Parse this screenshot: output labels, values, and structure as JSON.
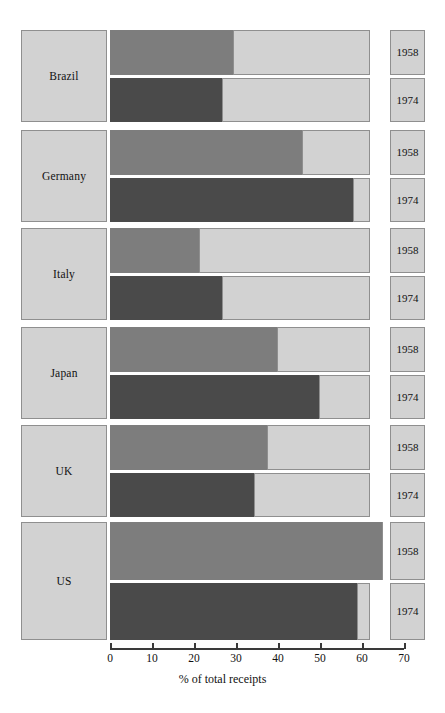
{
  "chart_data": {
    "type": "bar",
    "title": "",
    "xlabel": "% of total receipts",
    "ylabel": "",
    "xlim": [
      0,
      70
    ],
    "xticks": [
      0,
      10,
      20,
      30,
      40,
      50,
      60,
      70
    ],
    "xtick_labels": [
      "0",
      "10",
      "20",
      "30",
      "40",
      "50",
      "60",
      "70"
    ],
    "grid": false,
    "legend": "none",
    "orientation": "horizontal",
    "categories": [
      "Brazil",
      "Germany",
      "Italy",
      "Japan",
      "UK",
      "US"
    ],
    "series": [
      {
        "name": "1958",
        "values": [
          29.5,
          46,
          21.5,
          40,
          37.5,
          65
        ]
      },
      {
        "name": "1974",
        "values": [
          27,
          58,
          27,
          50,
          34.5,
          59
        ]
      }
    ],
    "colors": {
      "series_1958": "#7d7d7d",
      "series_1974": "#4a4a4a",
      "track": "#d2d2d2",
      "border": "#8f8f8f",
      "axis": "#3a3a3a",
      "background": "#ffffff"
    }
  },
  "groups": [
    {
      "country": "Brazil",
      "rows": [
        {
          "year": "1958",
          "value": 29.5
        },
        {
          "year": "1974",
          "value": 27
        }
      ]
    },
    {
      "country": "Germany",
      "rows": [
        {
          "year": "1958",
          "value": 46
        },
        {
          "year": "1974",
          "value": 58
        }
      ]
    },
    {
      "country": "Italy",
      "rows": [
        {
          "year": "1958",
          "value": 21.5
        },
        {
          "year": "1974",
          "value": 27
        }
      ]
    },
    {
      "country": "Japan",
      "rows": [
        {
          "year": "1958",
          "value": 40
        },
        {
          "year": "1974",
          "value": 50
        }
      ]
    },
    {
      "country": "UK",
      "rows": [
        {
          "year": "1958",
          "value": 37.5
        },
        {
          "year": "1974",
          "value": 34.5
        }
      ]
    },
    {
      "country": "US",
      "rows": [
        {
          "year": "1958",
          "value": 65
        },
        {
          "year": "1974",
          "value": 59
        }
      ]
    }
  ],
  "axis": {
    "title": "% of total receipts",
    "ticks": [
      "0",
      "10",
      "20",
      "30",
      "40",
      "50",
      "60",
      "70"
    ]
  }
}
